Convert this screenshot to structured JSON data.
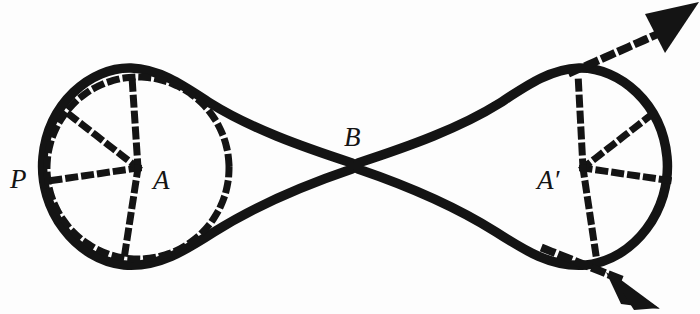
{
  "figure": {
    "background_color": "#fdfdfd",
    "ink_color": "#141414",
    "labels": {
      "p": "P",
      "a": "A",
      "b": "B",
      "a_prime": "A′"
    },
    "label_positions": {
      "p": {
        "x": 10,
        "y": 186
      },
      "a": {
        "x": 154,
        "y": 187
      },
      "b": {
        "x": 345,
        "y": 145
      },
      "a_prime": {
        "x": 538,
        "y": 187
      }
    },
    "points": {
      "A": {
        "x": 138,
        "y": 168,
        "label": "A"
      },
      "B": {
        "x": 355,
        "y": 166,
        "label": "B"
      },
      "A_prime": {
        "x": 583,
        "y": 168,
        "label": "A′"
      },
      "P": {
        "x": 44,
        "y": 170,
        "label": "P"
      }
    },
    "left_lobe": {
      "center": {
        "x": 138,
        "y": 168
      },
      "radius": 92,
      "dashed_circle": true,
      "spokes_deg": [
        188,
        218,
        266,
        305,
        2
      ]
    },
    "right_lobe": {
      "center": {
        "x": 583,
        "y": 168
      },
      "radius": 92,
      "dashed_circle": false,
      "spokes_deg": [
        -8,
        28,
        75,
        115,
        178
      ]
    },
    "arrows": [
      {
        "name": "upper-right-arrow",
        "from": {
          "x": 583,
          "y": 168
        },
        "to": {
          "x": 690,
          "y": 14
        },
        "style": "dashed"
      },
      {
        "name": "lower-right-arrow",
        "from": {
          "x": 583,
          "y": 168
        },
        "to": {
          "x": 665,
          "y": 302
        },
        "style": "dashed"
      }
    ],
    "strokes": {
      "outline_width": 9,
      "dash_width": 7,
      "dash_pattern": "6 9"
    }
  }
}
